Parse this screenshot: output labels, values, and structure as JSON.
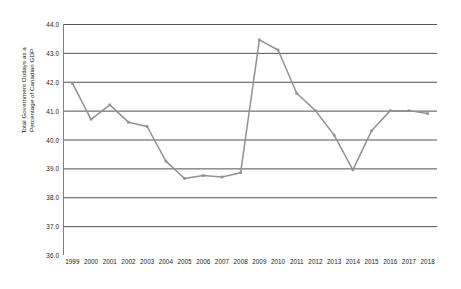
{
  "chart_data": {
    "type": "line",
    "title": "",
    "xlabel": "",
    "ylabel": "Total Government Outlays as a\nPercentage of Canadian GDP",
    "categories": [
      "1999",
      "2000",
      "2001",
      "2002",
      "2003",
      "2004",
      "2005",
      "2006",
      "2007",
      "2008",
      "2009",
      "2010",
      "2011",
      "2012",
      "2013",
      "2014",
      "2015",
      "2016",
      "2017",
      "2018"
    ],
    "values": [
      41.95,
      40.7,
      41.2,
      40.6,
      40.45,
      39.25,
      38.65,
      38.75,
      38.7,
      38.85,
      43.45,
      43.1,
      41.6,
      41.0,
      40.15,
      38.95,
      40.3,
      41.0,
      41.0,
      40.9
    ],
    "series": [
      {
        "name": "Total Government Outlays as a Percentage of Canadian GDP",
        "values": [
          41.95,
          40.7,
          41.2,
          40.6,
          40.45,
          39.25,
          38.65,
          38.75,
          38.7,
          38.85,
          43.45,
          43.1,
          41.6,
          41.0,
          40.15,
          38.95,
          40.3,
          41.0,
          41.0,
          40.9
        ]
      }
    ],
    "ylim": [
      36.0,
      44.0
    ],
    "ytick_step": 1.0,
    "yticks": [
      "44.0",
      "43.0",
      "42.0",
      "41.0",
      "40.0",
      "39.0",
      "38.0",
      "37.0",
      "36.0"
    ],
    "ytick_values": [
      44.0,
      43.0,
      42.0,
      41.0,
      40.0,
      39.0,
      38.0,
      37.0,
      36.0
    ],
    "grid": true,
    "grid_axis": "y",
    "legend": "none",
    "marker": "square",
    "series_color": "#919191",
    "grid_color": "#3f3f3f",
    "axis_color": "#808080",
    "background_color": "#ffffff"
  }
}
